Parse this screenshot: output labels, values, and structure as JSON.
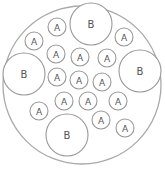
{
  "diagram": {
    "outer": {
      "cx": 82,
      "cy": 85,
      "r": 79,
      "stroke": "#aaaaaa"
    },
    "circle_stroke": "#999999",
    "circles": [
      {
        "label": "B",
        "cx": 91,
        "cy": 24,
        "r": 21
      },
      {
        "label": "A",
        "cx": 57,
        "cy": 27,
        "r": 9
      },
      {
        "label": "A",
        "cx": 34,
        "cy": 41,
        "r": 9
      },
      {
        "label": "A",
        "cx": 124,
        "cy": 37,
        "r": 9
      },
      {
        "label": "A",
        "cx": 56,
        "cy": 54,
        "r": 9
      },
      {
        "label": "A",
        "cx": 80,
        "cy": 57,
        "r": 9
      },
      {
        "label": "A",
        "cx": 107,
        "cy": 58,
        "r": 9
      },
      {
        "label": "B",
        "cx": 24,
        "cy": 74,
        "r": 21
      },
      {
        "label": "B",
        "cx": 140,
        "cy": 71,
        "r": 21
      },
      {
        "label": "A",
        "cx": 57,
        "cy": 77,
        "r": 9
      },
      {
        "label": "A",
        "cx": 79,
        "cy": 80,
        "r": 9
      },
      {
        "label": "A",
        "cx": 102,
        "cy": 82,
        "r": 9
      },
      {
        "label": "A",
        "cx": 64,
        "cy": 101,
        "r": 9
      },
      {
        "label": "A",
        "cx": 88,
        "cy": 101,
        "r": 9
      },
      {
        "label": "A",
        "cx": 118,
        "cy": 101,
        "r": 9
      },
      {
        "label": "A",
        "cx": 39,
        "cy": 111,
        "r": 9
      },
      {
        "label": "B",
        "cx": 67,
        "cy": 135,
        "r": 21
      },
      {
        "label": "A",
        "cx": 101,
        "cy": 120,
        "r": 9
      },
      {
        "label": "A",
        "cx": 125,
        "cy": 128,
        "r": 9
      }
    ]
  }
}
